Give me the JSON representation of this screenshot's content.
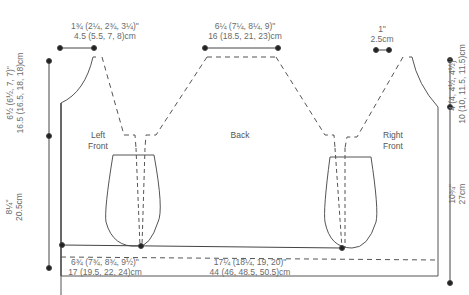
{
  "diagram": {
    "type": "knitting-schematic",
    "colors": {
      "line": "#555555",
      "text": "#6a6a6a",
      "background": "#ffffff"
    },
    "pieces": [
      {
        "id": "left-front",
        "label_line1": "Left",
        "label_line2": "Front"
      },
      {
        "id": "back",
        "label_line1": "Back"
      },
      {
        "id": "right-front",
        "label_line1": "Right",
        "label_line2": "Front"
      }
    ],
    "measurements": {
      "left_shoulder": {
        "imperial": "1¾ (2¼, 2¾, 3¼)\"",
        "metric": "4.5 (5.5, 7, 8)cm"
      },
      "back_neck": {
        "imperial": "6¼ (7¼, 8¼, 9)\"",
        "metric": "16 (18.5, 21, 23)cm"
      },
      "right_shoulder": {
        "imperial": "1\"",
        "metric": "2.5cm"
      },
      "left_armhole_depth": {
        "imperial": "6½ (6½, 7, 7)\"",
        "metric": "16.5 (16.5, 18, 18)cm"
      },
      "left_body_length": {
        "imperial": "8¼\"",
        "metric": "20.5cm"
      },
      "right_armhole_depth": {
        "imperial": "4 (4, 4½, 4½)\"",
        "metric": "10 (10, 11.5, 11.5)cm"
      },
      "right_body_length": {
        "imperial": "10¾\"",
        "metric": "27cm"
      },
      "front_width": {
        "imperial": "6¾ (7¾, 8¾, 9½)\"",
        "metric": "17 (19.5, 22, 24)cm"
      },
      "back_width": {
        "imperial": "17¼ (18¼, 19, 20)\"",
        "metric": "44 (46, 48.5, 50.5)cm"
      }
    }
  }
}
